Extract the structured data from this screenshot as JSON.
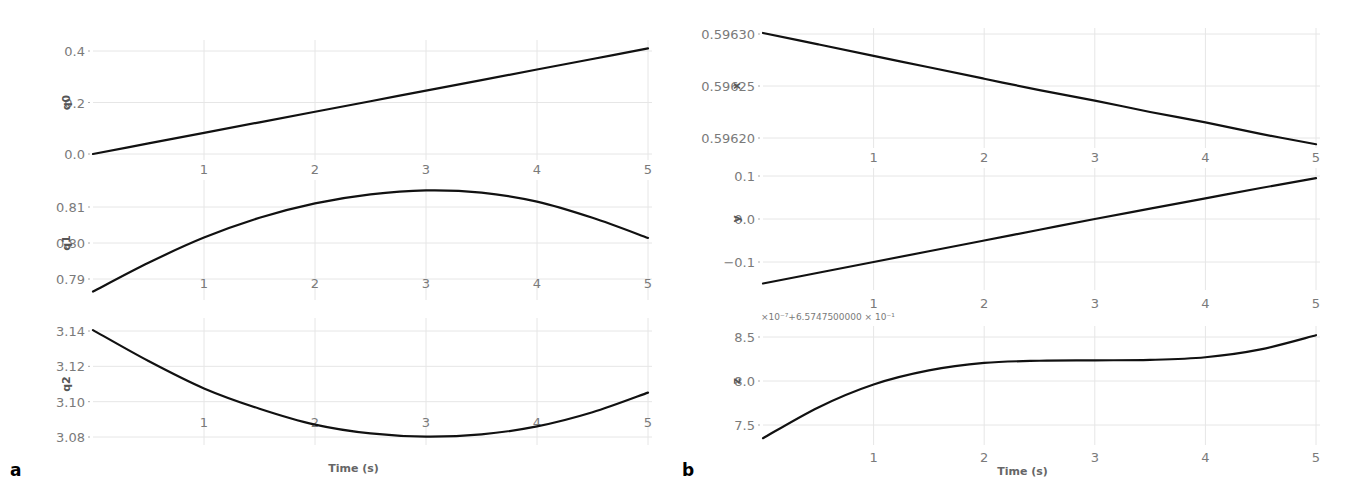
{
  "chart_data": [
    {
      "panel": "a",
      "type": "line",
      "xlabel": "Time (s)",
      "x": [
        0,
        0.5,
        1,
        1.5,
        2,
        2.5,
        3,
        3.5,
        4,
        4.5,
        5
      ],
      "xticks": [
        1,
        2,
        3,
        4,
        5
      ],
      "xlim": [
        0,
        5
      ],
      "subplots": [
        {
          "ylabel": "q0",
          "yticks": [
            "0.0",
            "0.2",
            "0.4"
          ],
          "ylim": [
            0.0,
            0.4
          ],
          "values": [
            0.0,
            0.041,
            0.082,
            0.123,
            0.164,
            0.205,
            0.246,
            0.287,
            0.328,
            0.369,
            0.41
          ]
        },
        {
          "ylabel": "q1",
          "yticks": [
            "0.79",
            "0.80",
            "0.81"
          ],
          "ylim": [
            0.79,
            0.81
          ],
          "values": [
            0.7865,
            0.7945,
            0.8015,
            0.807,
            0.811,
            0.8135,
            0.8146,
            0.814,
            0.8115,
            0.807,
            0.8014
          ]
        },
        {
          "ylabel": "q2",
          "yticks": [
            "3.08",
            "3.10",
            "3.12",
            "3.14"
          ],
          "ylim": [
            3.08,
            3.14
          ],
          "values": [
            3.1405,
            3.123,
            3.1075,
            3.096,
            3.087,
            3.082,
            3.0802,
            3.0815,
            3.086,
            3.094,
            3.1051
          ]
        }
      ]
    },
    {
      "panel": "b",
      "type": "line",
      "xlabel": "Time (s)",
      "x": [
        0,
        0.5,
        1,
        1.5,
        2,
        2.5,
        3,
        3.5,
        4,
        4.5,
        5
      ],
      "xticks": [
        1,
        2,
        3,
        4,
        5
      ],
      "xlim": [
        0,
        5
      ],
      "subplots": [
        {
          "ylabel": "x",
          "yticks": [
            "0.59620",
            "0.59625",
            "0.59630"
          ],
          "ylim": [
            0.5962,
            0.5963
          ],
          "values": [
            0.596301,
            0.59629,
            0.596279,
            0.596268,
            0.596257,
            0.596246,
            0.596236,
            0.596225,
            0.596215,
            0.596204,
            0.596194
          ]
        },
        {
          "ylabel": "y",
          "yticks": [
            "-0.1",
            "0.0",
            "0.1"
          ],
          "ylim": [
            -0.1,
            0.1
          ],
          "values": [
            -0.15,
            -0.125,
            -0.1,
            -0.075,
            -0.05,
            -0.025,
            0.0,
            0.024,
            0.048,
            0.072,
            0.095
          ]
        },
        {
          "ylabel": "z",
          "yticks": [
            "7.5",
            "8.0",
            "8.5"
          ],
          "ylim": [
            7.5,
            8.5
          ],
          "offset_label": "×10⁻⁷+6.5747500000×10⁻¹",
          "values": [
            7.35,
            7.7,
            7.96,
            8.12,
            8.205,
            8.23,
            8.235,
            8.24,
            8.27,
            8.36,
            8.52
          ]
        }
      ]
    }
  ],
  "labels": {
    "panel_a": "a",
    "panel_b": "b",
    "xlabel": "Time (s)",
    "z_offset": "×10⁻⁷+6.5747500000 × 10⁻¹"
  }
}
